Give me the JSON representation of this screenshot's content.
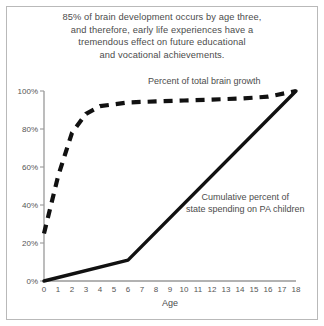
{
  "title": {
    "lines": [
      "85% of brain development occurs by age three,",
      "and therefore, early life experiences have a",
      "tremendous effect on future educational",
      "and vocational achievements."
    ]
  },
  "colors": {
    "axis": "#999999",
    "line": "#111111",
    "text": "#4c4c4c",
    "frame": "#b9b9b9",
    "background": "#ffffff"
  },
  "chart_data": {
    "type": "line",
    "title": "85% of brain development occurs by age three, and therefore, early life experiences have a tremendous effect on future educational and vocational achievements.",
    "xlabel": "Age",
    "ylabel": "",
    "xlim": [
      0,
      18
    ],
    "ylim": [
      0,
      100
    ],
    "grid": false,
    "legend_position": "inline-annotations",
    "xticks": [
      0,
      1,
      2,
      3,
      4,
      5,
      6,
      7,
      8,
      9,
      10,
      11,
      12,
      13,
      14,
      15,
      16,
      17,
      18
    ],
    "xticklabels": [
      "0",
      "1",
      "2",
      "3",
      "4",
      "5",
      "6",
      "7",
      "8",
      "9",
      "10",
      "11",
      "12",
      "13",
      "14",
      "15",
      "16",
      "17",
      "18"
    ],
    "yticks": [
      0,
      20,
      40,
      60,
      80,
      100
    ],
    "yticklabels": [
      "0%",
      "20%",
      "40%",
      "60%",
      "80%",
      "100%"
    ],
    "series": [
      {
        "name": "Percent of total brain growth",
        "style": "dashed",
        "x": [
          0,
          1,
          2,
          3,
          4,
          5,
          6,
          8,
          10,
          12,
          14,
          16,
          18
        ],
        "values": [
          25,
          55,
          78,
          88,
          92,
          93,
          94,
          94.5,
          95,
          95.5,
          96,
          97,
          100
        ]
      },
      {
        "name": "Cumulative percent of state spending on PA children",
        "style": "solid",
        "x": [
          0,
          6,
          18
        ],
        "values": [
          0,
          11,
          100
        ]
      }
    ],
    "annotations": [
      {
        "text": "Percent of total brain growth",
        "series": "Percent of total brain growth"
      },
      {
        "text": "Cumulative percent of",
        "series": "Cumulative percent of state spending on PA children"
      },
      {
        "text": "state spending on PA children",
        "series": "Cumulative percent of state spending on PA children"
      }
    ]
  }
}
